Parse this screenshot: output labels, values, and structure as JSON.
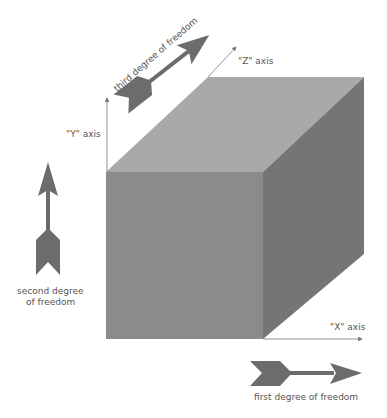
{
  "diagram": {
    "type": "3D cube with axes and degrees of freedom",
    "axes": {
      "x_label": "\"X\" axis",
      "y_label": "\"Y\" axis",
      "z_label": "\"Z\" axis"
    },
    "arrows": {
      "first": "first degree of freedom",
      "second_line1": "second degree",
      "second_line2": "of freedom",
      "third": "third degree of freedom"
    },
    "colors": {
      "top_face": "#a9a9a9",
      "front_face": "#8b8b8b",
      "right_face": "#757575",
      "arrow": "#6c6c6c",
      "axis_line": "#777777"
    }
  }
}
